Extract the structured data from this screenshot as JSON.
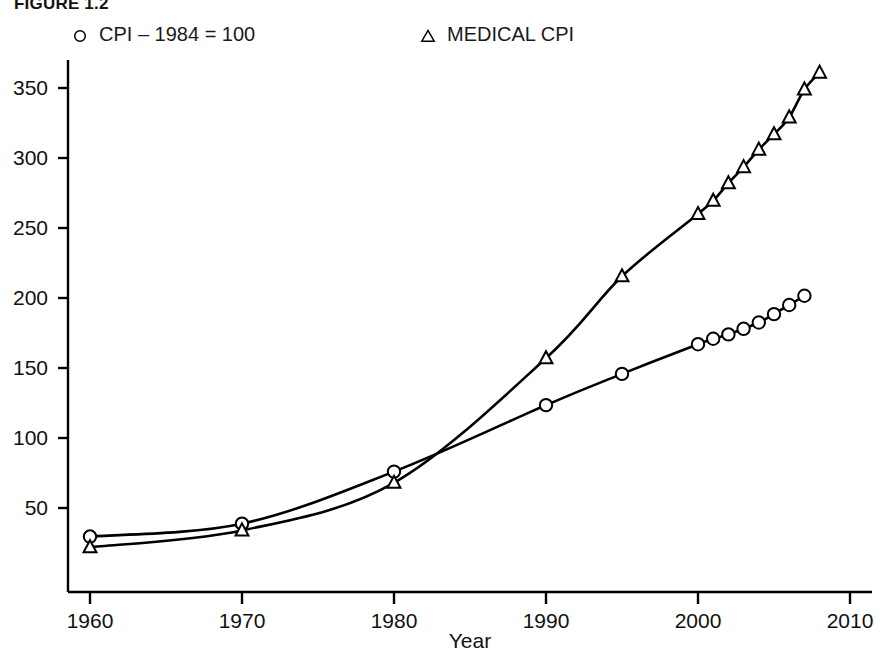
{
  "figure": {
    "title": "FIGURE 1.2",
    "background": "#ffffff",
    "ink_color": "#000000"
  },
  "legend": {
    "position": "top",
    "entries": [
      {
        "marker": "circle-marker-icon",
        "label": "CPI – 1984 = 100"
      },
      {
        "marker": "triangle-marker-icon",
        "label": "MEDICAL CPI"
      }
    ]
  },
  "axes": {
    "x": {
      "label": "Year",
      "ticks": [
        "1960",
        "1970",
        "1980",
        "1990",
        "2000",
        "2010"
      ],
      "tick_values": [
        1960,
        1970,
        1980,
        1990,
        2000,
        2010
      ],
      "range": [
        1960,
        2010
      ]
    },
    "y": {
      "label": "",
      "ticks": [
        "50",
        "100",
        "150",
        "200",
        "250",
        "300",
        "350"
      ],
      "tick_values": [
        50,
        100,
        150,
        200,
        250,
        300,
        350
      ],
      "range": [
        0,
        380
      ]
    }
  },
  "chart_data": {
    "type": "line",
    "title": "FIGURE 1.2",
    "subtitle": "",
    "xlabel": "Year",
    "ylabel": "",
    "xlim": [
      1960,
      2010
    ],
    "ylim": [
      0,
      380
    ],
    "grid": false,
    "legend_position": "top",
    "annotations": [],
    "series": [
      {
        "name": "CPI – 1984 = 100",
        "marker": "circle",
        "color": "#000000",
        "x": [
          1960,
          1970,
          1980,
          1990,
          1995,
          2000,
          2001,
          2002,
          2003,
          2004,
          2005,
          2006,
          2007
        ],
        "y": [
          29.6,
          38.8,
          76.0,
          123.5,
          145.8,
          167.0,
          170.9,
          174.0,
          178.0,
          182.5,
          188.5,
          195.0,
          201.6
        ]
      },
      {
        "name": "MEDICAL CPI",
        "marker": "triangle",
        "color": "#000000",
        "x": [
          1960,
          1970,
          1980,
          1990,
          1995,
          2000,
          2001,
          2002,
          2003,
          2004,
          2005,
          2006,
          2007,
          2008
        ],
        "y": [
          22.0,
          34.0,
          68.0,
          157.0,
          215.5,
          260.0,
          269.5,
          282.0,
          293.5,
          306.0,
          317.0,
          329.0,
          349.0,
          361.0
        ]
      }
    ]
  }
}
